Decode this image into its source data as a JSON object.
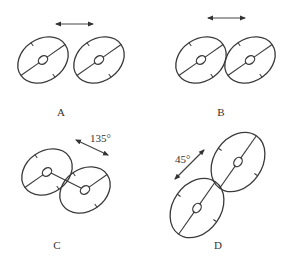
{
  "panels": [
    {
      "id": "A",
      "label": "A",
      "orientation_deg": 0,
      "angle_text": "",
      "arrangement": "side-by-side, separated"
    },
    {
      "id": "B",
      "label": "B",
      "orientation_deg": 0,
      "angle_text": "",
      "arrangement": "side-by-side, touching"
    },
    {
      "id": "C",
      "label": "C",
      "orientation_deg": 135,
      "angle_text": "135°",
      "arrangement": "diagonal, touching"
    },
    {
      "id": "D",
      "label": "D",
      "orientation_deg": 45,
      "angle_text": "45°",
      "arrangement": "diagonal, touching"
    }
  ],
  "colors": {
    "stroke": "#3a3a3a",
    "background": "#ffffff"
  }
}
